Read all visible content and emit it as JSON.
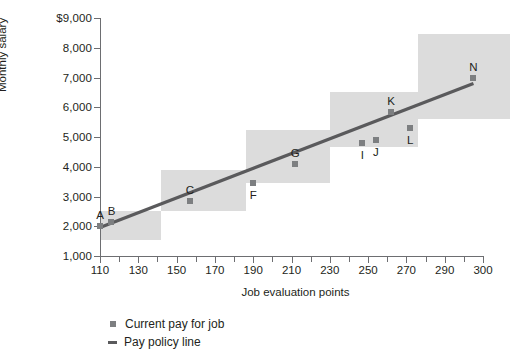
{
  "chart_data": {
    "type": "scatter",
    "title": "",
    "xlabel": "Job evaluation points",
    "ylabel": "Monthly salary",
    "xlim": [
      110,
      310
    ],
    "ylim": [
      1000,
      9000
    ],
    "grid": false,
    "legend_position": "bottom-left",
    "y_tick_labels": [
      "$9,000",
      "8,000",
      "7,000",
      "6,000",
      "5,000",
      "4,000",
      "3,000",
      "2,000",
      "1,000"
    ],
    "y_ticks": [
      9000,
      8000,
      7000,
      6000,
      5000,
      4000,
      3000,
      2000,
      1000
    ],
    "x_tick_labels": [
      "110",
      "130",
      "150",
      "170",
      "190",
      "210",
      "230",
      "250",
      "270",
      "290",
      "300"
    ],
    "x_ticks": [
      110,
      130,
      150,
      170,
      190,
      210,
      230,
      250,
      270,
      290,
      310
    ],
    "x_minor_ticks": [
      120,
      140,
      160,
      180,
      200,
      220,
      240,
      260,
      280,
      300
    ],
    "series": [
      {
        "name": "Current pay for job",
        "type": "scatter",
        "color": "#7d7f81",
        "points": [
          {
            "label": "A",
            "x": 110,
            "y": 2000
          },
          {
            "label": "B",
            "x": 116,
            "y": 2150
          },
          {
            "label": "C",
            "x": 157,
            "y": 2850
          },
          {
            "label": "F",
            "x": 190,
            "y": 3450
          },
          {
            "label": "G",
            "x": 212,
            "y": 4100
          },
          {
            "label": "I",
            "x": 247,
            "y": 4800
          },
          {
            "label": "J",
            "x": 254,
            "y": 4900
          },
          {
            "label": "K",
            "x": 262,
            "y": 5850
          },
          {
            "label": "L",
            "x": 272,
            "y": 5300
          },
          {
            "label": "N",
            "x": 305,
            "y": 7000
          }
        ]
      },
      {
        "name": "Pay policy line",
        "type": "line",
        "color": "#5a5a5c",
        "x": [
          110,
          305
        ],
        "y": [
          1960,
          6800
        ]
      }
    ],
    "grade_boxes": [
      {
        "x0": 110,
        "x1": 142,
        "y0": 1550,
        "y1": 2500
      },
      {
        "x0": 142,
        "x1": 186,
        "y0": 2500,
        "y1": 3900
      },
      {
        "x0": 186,
        "x1": 230,
        "y0": 3450,
        "y1": 5250
      },
      {
        "x0": 230,
        "x1": 276,
        "y0": 4650,
        "y1": 6500
      },
      {
        "x0": 276,
        "x1": 324,
        "y0": 5600,
        "y1": 8450
      }
    ],
    "legend_entries": [
      {
        "label": "Current pay for job",
        "marker": "square",
        "color": "#7d7f81"
      },
      {
        "label": "Pay policy line",
        "marker": "line",
        "color": "#5a5a5c"
      }
    ]
  }
}
